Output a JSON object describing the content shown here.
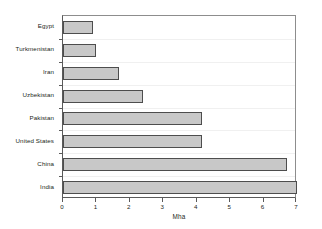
{
  "chart_data": {
    "type": "bar",
    "orientation": "horizontal",
    "title": "",
    "xlabel": "Mha",
    "ylabel": "",
    "xlim": [
      0,
      7
    ],
    "xticks": [
      0,
      1,
      2,
      3,
      4,
      5,
      6,
      7
    ],
    "xticklabels": [
      "0",
      "1",
      "2",
      "3",
      "4",
      "5",
      "6",
      "7"
    ],
    "grid": "horizontal-faint",
    "legend": "none",
    "categories": [
      "Egypt",
      "Turkmenistan",
      "Iran",
      "Uzbekistan",
      "Pakistan",
      "United States",
      "China",
      "India"
    ],
    "values": [
      0.9,
      1.0,
      1.67,
      2.4,
      4.15,
      4.15,
      6.7,
      7.0
    ],
    "series": [
      {
        "name": "Area",
        "values": [
          0.9,
          1.0,
          1.67,
          2.4,
          4.15,
          4.15,
          6.7,
          7.0
        ]
      }
    ],
    "colors": {
      "bar_fill": "#c8c8c8",
      "bar_border": "#4d4d4d",
      "axis": "#5a5a5a",
      "grid": "#f0f0f0",
      "background": "#ffffff",
      "text": "#231f20"
    }
  }
}
